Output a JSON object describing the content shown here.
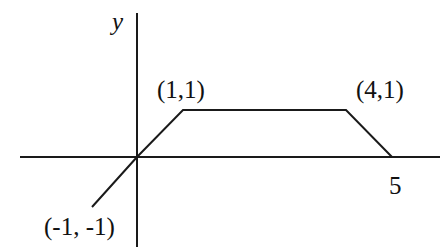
{
  "diagram": {
    "type": "piecewise-linear-graph",
    "axes": {
      "y_label": "y",
      "x_label": ""
    },
    "points": [
      {
        "x": -1,
        "y": -1,
        "label": "(-1, -1)"
      },
      {
        "x": 0,
        "y": 0,
        "label": ""
      },
      {
        "x": 1,
        "y": 1,
        "label": "(1,1)"
      },
      {
        "x": 4,
        "y": 1,
        "label": "(4,1)"
      },
      {
        "x": 5,
        "y": 0,
        "label": "5"
      }
    ],
    "labels": {
      "y_axis": "y",
      "point_1_1": "(1,1)",
      "point_4_1": "(4,1)",
      "point_5_0": "5",
      "point_neg1_neg1": "(-1, -1)"
    },
    "colors": {
      "line": "#1a1a1a",
      "background": "#ffffff"
    }
  }
}
